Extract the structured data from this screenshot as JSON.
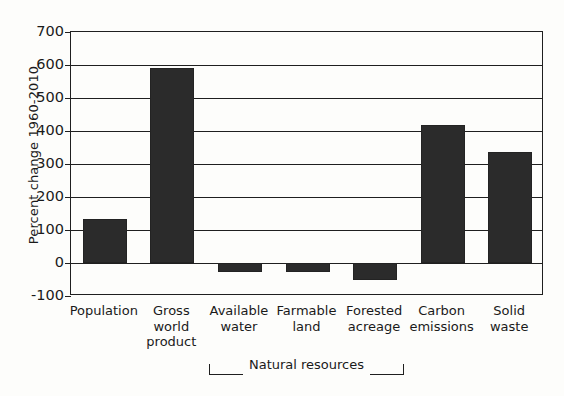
{
  "chart_data": {
    "type": "bar",
    "title": "",
    "xlabel": "",
    "ylabel": "Percent change 1960-2010",
    "categories": [
      "Population",
      "Gross world product",
      "Available water",
      "Farmable land",
      "Forested acreage",
      "Carbon emissions",
      "Solid waste"
    ],
    "category_lines": [
      [
        "Population"
      ],
      [
        "Gross",
        "world",
        "product"
      ],
      [
        "Available",
        "water"
      ],
      [
        "Farmable",
        "land"
      ],
      [
        "Forested",
        "acreage"
      ],
      [
        "Carbon",
        "emissions"
      ],
      [
        "Solid",
        "waste"
      ]
    ],
    "values": [
      133,
      590,
      -27,
      -28,
      -52,
      418,
      335
    ],
    "ylim": [
      -100,
      700
    ],
    "yticks": [
      700,
      600,
      500,
      400,
      300,
      200,
      100,
      0,
      -100
    ],
    "ytick_labels": [
      "700",
      "600",
      "500",
      "400",
      "300",
      "200",
      "100",
      "0",
      "-100"
    ],
    "grid": true,
    "legend": false,
    "bar_color": "#2b2b2b",
    "axis_color": "#1f1f1f",
    "background_color": "#fdfdfb",
    "annotations": [
      {
        "text": "Natural resources",
        "type": "group-bracket",
        "spans_categories": [
          "Available water",
          "Farmable land",
          "Forested acreage"
        ]
      }
    ]
  }
}
